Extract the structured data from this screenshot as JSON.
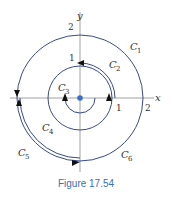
{
  "figure": {
    "caption": "Figure 17.54",
    "axes": {
      "x_label": "x",
      "y_label": "y"
    },
    "ticks": {
      "x_1": "1",
      "x_2": "2",
      "y_1": "1",
      "y_2": "2"
    },
    "curves": [
      {
        "name": "C1",
        "label": "C",
        "sub": "1"
      },
      {
        "name": "C2",
        "label": "C",
        "sub": "2"
      },
      {
        "name": "C3",
        "label": "C",
        "sub": "3"
      },
      {
        "name": "C4",
        "label": "C",
        "sub": "4"
      },
      {
        "name": "C5",
        "label": "C",
        "sub": "5"
      },
      {
        "name": "C6",
        "label": "C",
        "sub": "6"
      }
    ],
    "colors": {
      "curve": "#3a4a8c",
      "axis": "#8a8a8a",
      "origin": "#3a6fc4",
      "caption": "#3b6fb6"
    }
  }
}
